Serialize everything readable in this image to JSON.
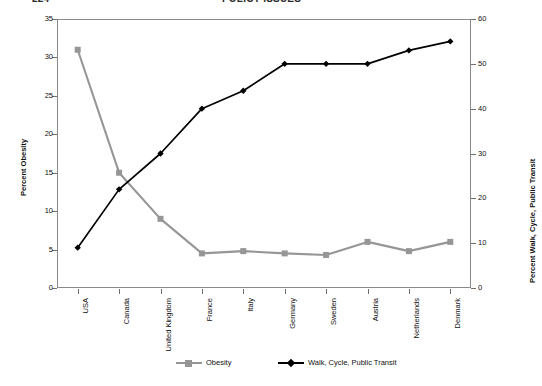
{
  "page_header": {
    "folio": "224",
    "running_title": "POLICY ISSUES"
  },
  "chart_data": {
    "type": "line",
    "title": "",
    "xlabel": "",
    "categories": [
      "USA",
      "Canada",
      "United Kingdom",
      "France",
      "Italy",
      "Germany",
      "Sweden",
      "Austria",
      "Netherlands",
      "Denmark"
    ],
    "series": [
      {
        "name": "Obesity",
        "axis": "left",
        "color": "#969696",
        "marker": "square",
        "values": [
          31,
          15,
          9,
          4.5,
          4.8,
          4.5,
          4.3,
          6,
          4.8,
          6
        ]
      },
      {
        "name": "Walk, Cycle, Public Transit",
        "axis": "right",
        "color": "#000000",
        "marker": "diamond",
        "values": [
          9,
          22,
          30,
          40,
          44,
          50,
          50,
          50,
          53,
          55
        ]
      }
    ],
    "left_axis": {
      "label": "Percent Obesity",
      "ylim": [
        0,
        35
      ],
      "ticks": [
        0,
        5,
        10,
        15,
        20,
        25,
        30,
        35
      ]
    },
    "right_axis": {
      "label": "Percent Walk, Cycle, Public Transit",
      "ylim": [
        0,
        60
      ],
      "ticks": [
        0,
        10,
        20,
        30,
        40,
        50,
        60
      ]
    },
    "legend": {
      "position": "bottom",
      "entries": [
        {
          "label": "Obesity",
          "color": "#969696",
          "marker": "square"
        },
        {
          "label": "Walk, Cycle, Public Transit",
          "color": "#000000",
          "marker": "diamond"
        }
      ]
    },
    "grid": false
  }
}
